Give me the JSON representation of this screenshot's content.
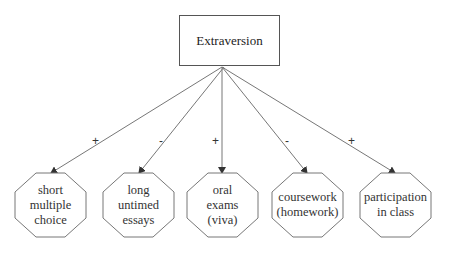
{
  "diagram": {
    "root": {
      "label": "Extraversion"
    },
    "children": [
      {
        "label": "short multiple choice",
        "lines": [
          "short",
          "multiple",
          "choice"
        ],
        "sign": "+"
      },
      {
        "label": "long untimed essays",
        "lines": [
          "long",
          "untimed",
          "essays"
        ],
        "sign": "-"
      },
      {
        "label": "oral exams (viva)",
        "lines": [
          "oral",
          "exams",
          "(viva)"
        ],
        "sign": "+"
      },
      {
        "label": "coursework (homework)",
        "lines": [
          "coursework",
          "(homework)"
        ],
        "sign": "-"
      },
      {
        "label": "participation in class",
        "lines": [
          "participation",
          "in class"
        ],
        "sign": "+"
      }
    ],
    "colors": {
      "stroke": "#666666",
      "text": "#333333",
      "background": "#ffffff"
    }
  }
}
